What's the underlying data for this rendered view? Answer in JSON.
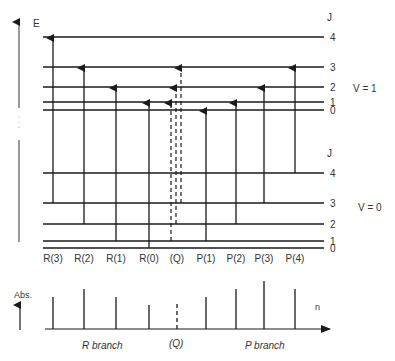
{
  "diagram": {
    "energy_axis_label": "E",
    "j_header_upper": "J",
    "j_header_lower": "J",
    "upper_state_label": "V = 1",
    "lower_state_label": "V = 0",
    "upper_levels": [
      {
        "j": "4",
        "y": 37
      },
      {
        "j": "3",
        "y": 67
      },
      {
        "j": "2",
        "y": 87
      },
      {
        "j": "1",
        "y": 102
      },
      {
        "j": "0",
        "y": 110
      }
    ],
    "lower_levels": [
      {
        "j": "4",
        "y": 173
      },
      {
        "j": "3",
        "y": 203
      },
      {
        "j": "2",
        "y": 224
      },
      {
        "j": "1",
        "y": 241
      },
      {
        "j": "0",
        "y": 248
      }
    ],
    "transitions": [
      {
        "label": "R(3)",
        "x": 53,
        "from_j": 3,
        "to_j": 4,
        "style": "solid"
      },
      {
        "label": "R(2)",
        "x": 84,
        "from_j": 2,
        "to_j": 3,
        "style": "solid"
      },
      {
        "label": "R(1)",
        "x": 116,
        "from_j": 1,
        "to_j": 2,
        "style": "solid"
      },
      {
        "label": "R(0)",
        "x": 149,
        "from_j": 0,
        "to_j": 1,
        "style": "solid"
      },
      {
        "label": "(Q)",
        "x": 177,
        "from_j": null,
        "to_j": null,
        "style": "dashed"
      },
      {
        "label": "P(1)",
        "x": 206,
        "from_j": 1,
        "to_j": 0,
        "style": "solid"
      },
      {
        "label": "P(2)",
        "x": 236,
        "from_j": 2,
        "to_j": 1,
        "style": "solid"
      },
      {
        "label": "P(3)",
        "x": 264,
        "from_j": 3,
        "to_j": 2,
        "style": "solid"
      },
      {
        "label": "P(4)",
        "x": 295,
        "from_j": 4,
        "to_j": 3,
        "style": "solid"
      }
    ],
    "q_dashed_lines": [
      {
        "x": 171,
        "from_j": 1,
        "to_j": 1
      },
      {
        "x": 176,
        "from_j": 2,
        "to_j": 2
      },
      {
        "x": 181,
        "from_j": 3,
        "to_j": 3
      }
    ]
  },
  "spectrum": {
    "y_axis_label": "Abs.",
    "x_axis_label": "n",
    "r_branch_label": "R branch",
    "q_label": "(Q)",
    "p_branch_label": "P branch",
    "peaks": [
      {
        "label": "R(3)",
        "x": 53,
        "height": 32,
        "style": "solid"
      },
      {
        "label": "R(2)",
        "x": 84,
        "height": 40,
        "style": "solid"
      },
      {
        "label": "R(1)",
        "x": 116,
        "height": 32,
        "style": "solid"
      },
      {
        "label": "R(0)",
        "x": 149,
        "height": 24,
        "style": "solid"
      },
      {
        "label": "(Q)",
        "x": 177,
        "height": 26,
        "style": "dashed"
      },
      {
        "label": "P(1)",
        "x": 206,
        "height": 32,
        "style": "solid"
      },
      {
        "label": "P(2)",
        "x": 236,
        "height": 40,
        "style": "solid"
      },
      {
        "label": "P(3)",
        "x": 264,
        "height": 48,
        "style": "solid"
      },
      {
        "label": "P(4)",
        "x": 295,
        "height": 40,
        "style": "solid"
      }
    ]
  }
}
